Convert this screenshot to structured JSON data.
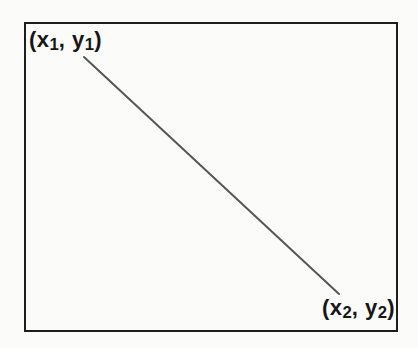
{
  "figure": {
    "background_color": "#fbfbfa",
    "box_border_color": "#1e1e1e",
    "line_color": "#565656",
    "line": {
      "x1": 84,
      "y1": 57,
      "x2": 339,
      "y2": 294,
      "stroke_width": 2
    },
    "labels": {
      "point1": {
        "open": "(x",
        "sub1": "1",
        "mid": ", y",
        "sub2": "1",
        "close": ")"
      },
      "point2": {
        "open": "(x",
        "sub1": "2",
        "mid": ", y",
        "sub2": "2",
        "close": ")"
      }
    }
  }
}
